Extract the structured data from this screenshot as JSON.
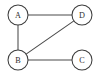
{
  "diagram": {
    "type": "node-link-graph",
    "background_color": "#ffffff",
    "stroke_color": "#4a4a4a",
    "node_fill_color": "#ffffff",
    "node_stroke_color": "#3d3d3d",
    "label_color": "#2e2e2e",
    "node_radius": 10,
    "nodes": [
      {
        "id": "A",
        "label": "A",
        "cx": 18,
        "cy": 15
      },
      {
        "id": "D",
        "label": "D",
        "cx": 82,
        "cy": 15
      },
      {
        "id": "B",
        "label": "B",
        "cx": 18,
        "cy": 60
      },
      {
        "id": "C",
        "label": "C",
        "cx": 82,
        "cy": 60
      }
    ],
    "edges": [
      {
        "id": "A-D",
        "from": "A",
        "to": "D",
        "x1": 28,
        "y1": 15,
        "x2": 72,
        "y2": 15
      },
      {
        "id": "A-B",
        "from": "A",
        "to": "B",
        "x1": 18,
        "y1": 25,
        "x2": 18,
        "y2": 50
      },
      {
        "id": "B-D",
        "from": "B",
        "to": "D",
        "x1": 26.1,
        "y1": 54.1,
        "x2": 73.9,
        "y2": 20.9
      },
      {
        "id": "B-C",
        "from": "B",
        "to": "C",
        "x1": 28,
        "y1": 60,
        "x2": 72,
        "y2": 60
      }
    ]
  }
}
